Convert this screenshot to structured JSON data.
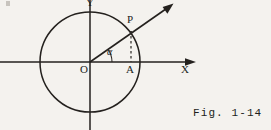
{
  "figure": {
    "caption": "Fig. 1-14",
    "background_color": "#f4f2ee",
    "ink_color": "#24211e",
    "labels": {
      "y_axis": "Y",
      "x_axis": "X",
      "origin": "O",
      "foot_point": "A",
      "circle_point": "P",
      "angle": "α"
    },
    "geometry": {
      "origin": {
        "x": 90,
        "y": 62
      },
      "circle_radius": 50,
      "circle_center": {
        "x": 90,
        "y": 62
      },
      "circle_left": {
        "x": 40,
        "y": 62
      },
      "circle_right": {
        "x": 140,
        "y": 62
      },
      "circle_top": {
        "x": 90,
        "y": 12
      },
      "circle_bottom": {
        "x": 90,
        "y": 112
      },
      "point_p": {
        "x": 131,
        "y": 32
      },
      "point_a": {
        "x": 131,
        "y": 62
      },
      "ray_tip": {
        "x": 173,
        "y": 4
      },
      "angle_degrees": 36,
      "x_axis_start": {
        "x": 0,
        "y": 62
      },
      "x_axis_end": {
        "x": 196,
        "y": 62
      },
      "y_axis_start": {
        "x": 90,
        "y": 0
      },
      "y_axis_end": {
        "x": 90,
        "y": 130
      },
      "angle_arc_radius": 22
    }
  }
}
